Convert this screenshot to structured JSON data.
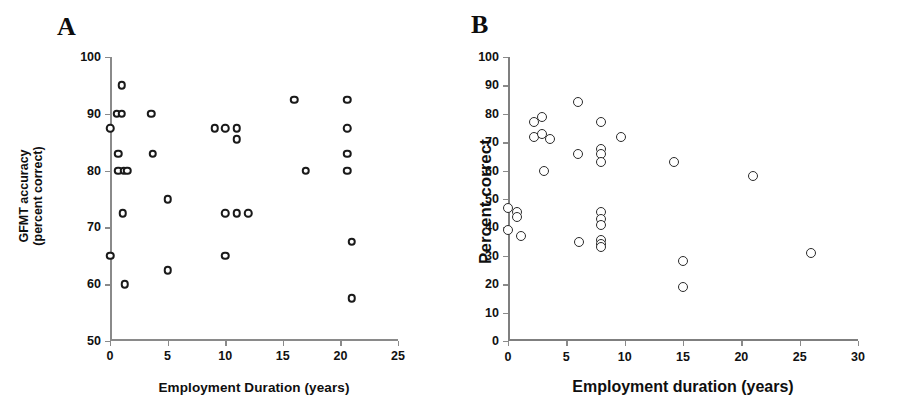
{
  "figure": {
    "background": "#ffffff",
    "marker_color": "#1a1a1a",
    "axis_color": "#8a8a8a"
  },
  "panels": [
    {
      "letter": "A",
      "name": "panel-a"
    },
    {
      "letter": "B",
      "name": "panel-b"
    }
  ],
  "chart_data": [
    {
      "type": "scatter",
      "panel": "A",
      "title": "",
      "xlabel": "Employment Duration (years)",
      "ylabel_line1": "GFMT accuracy",
      "ylabel_line2": "(percent correct)",
      "ylabel": "GFMT accuracy (percent correct)",
      "xlim": [
        0,
        25
      ],
      "ylim": [
        50,
        100
      ],
      "xticks": [
        0,
        5,
        10,
        15,
        20,
        25
      ],
      "yticks": [
        50,
        60,
        70,
        80,
        90,
        100
      ],
      "xtick_labels": [
        "0",
        "5",
        "10",
        "15",
        "20",
        "25"
      ],
      "ytick_labels": [
        "50",
        "60",
        "70",
        "80",
        "90",
        "100"
      ],
      "grid": false,
      "legend": "none",
      "marker": "open-circle",
      "points": [
        {
          "x": 0.0,
          "y": 87.5
        },
        {
          "x": 0.0,
          "y": 65.0
        },
        {
          "x": 0.6,
          "y": 90.0
        },
        {
          "x": 1.0,
          "y": 90.0
        },
        {
          "x": 1.0,
          "y": 95.0
        },
        {
          "x": 0.7,
          "y": 80.0
        },
        {
          "x": 1.2,
          "y": 80.0
        },
        {
          "x": 1.5,
          "y": 80.0
        },
        {
          "x": 0.7,
          "y": 83.0
        },
        {
          "x": 1.1,
          "y": 72.5
        },
        {
          "x": 1.3,
          "y": 60.0
        },
        {
          "x": 3.6,
          "y": 90.0
        },
        {
          "x": 3.7,
          "y": 83.0
        },
        {
          "x": 5.0,
          "y": 75.0
        },
        {
          "x": 5.0,
          "y": 62.5
        },
        {
          "x": 9.1,
          "y": 87.5
        },
        {
          "x": 10.0,
          "y": 87.5
        },
        {
          "x": 10.0,
          "y": 72.5
        },
        {
          "x": 10.0,
          "y": 65.0
        },
        {
          "x": 11.0,
          "y": 87.5
        },
        {
          "x": 11.0,
          "y": 85.5
        },
        {
          "x": 11.0,
          "y": 72.5
        },
        {
          "x": 12.0,
          "y": 72.5
        },
        {
          "x": 16.0,
          "y": 92.5
        },
        {
          "x": 17.0,
          "y": 80.0
        },
        {
          "x": 20.6,
          "y": 92.5
        },
        {
          "x": 20.6,
          "y": 87.5
        },
        {
          "x": 20.6,
          "y": 83.0
        },
        {
          "x": 20.6,
          "y": 80.0
        },
        {
          "x": 21.0,
          "y": 67.5
        },
        {
          "x": 21.0,
          "y": 57.5
        }
      ]
    },
    {
      "type": "scatter",
      "panel": "B",
      "title": "",
      "xlabel": "Employment duration (years)",
      "ylabel": "Percent correct",
      "xlim": [
        0,
        30
      ],
      "ylim": [
        0,
        100
      ],
      "xticks": [
        0,
        5,
        10,
        15,
        20,
        25,
        30
      ],
      "yticks": [
        0,
        10,
        20,
        30,
        40,
        50,
        60,
        70,
        80,
        90,
        100
      ],
      "xtick_labels": [
        "0",
        "5",
        "10",
        "15",
        "20",
        "25",
        "30"
      ],
      "ytick_labels": [
        "0",
        "10",
        "20",
        "30",
        "40",
        "50",
        "60",
        "70",
        "80",
        "90",
        "100"
      ],
      "grid": false,
      "legend": "none",
      "marker": "open-circle",
      "points": [
        {
          "x": 0.0,
          "y": 47.0
        },
        {
          "x": 0.0,
          "y": 39.0
        },
        {
          "x": 0.8,
          "y": 45.5
        },
        {
          "x": 0.8,
          "y": 43.5
        },
        {
          "x": 1.1,
          "y": 37.0
        },
        {
          "x": 2.2,
          "y": 77.0
        },
        {
          "x": 2.2,
          "y": 72.0
        },
        {
          "x": 2.9,
          "y": 79.0
        },
        {
          "x": 2.9,
          "y": 73.0
        },
        {
          "x": 3.6,
          "y": 71.0
        },
        {
          "x": 3.1,
          "y": 60.0
        },
        {
          "x": 6.0,
          "y": 84.0
        },
        {
          "x": 6.0,
          "y": 66.0
        },
        {
          "x": 6.1,
          "y": 35.0
        },
        {
          "x": 8.0,
          "y": 77.0
        },
        {
          "x": 8.0,
          "y": 67.5
        },
        {
          "x": 8.0,
          "y": 66.0
        },
        {
          "x": 8.0,
          "y": 63.0
        },
        {
          "x": 8.0,
          "y": 45.5
        },
        {
          "x": 8.0,
          "y": 43.0
        },
        {
          "x": 8.0,
          "y": 41.0
        },
        {
          "x": 8.0,
          "y": 35.5
        },
        {
          "x": 8.0,
          "y": 34.0
        },
        {
          "x": 8.0,
          "y": 33.0
        },
        {
          "x": 9.7,
          "y": 72.0
        },
        {
          "x": 14.2,
          "y": 63.0
        },
        {
          "x": 15.0,
          "y": 28.0
        },
        {
          "x": 15.0,
          "y": 19.0
        },
        {
          "x": 21.0,
          "y": 58.0
        },
        {
          "x": 26.0,
          "y": 31.0
        }
      ]
    }
  ]
}
